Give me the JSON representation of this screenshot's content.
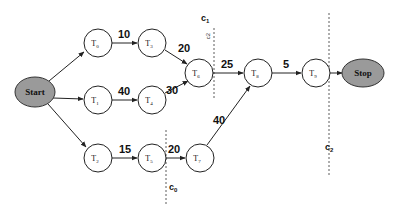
{
  "diagram": {
    "type": "task-graph",
    "terminals": {
      "start": {
        "label": "Start",
        "cx": 35,
        "cy": 92
      },
      "stop": {
        "label": "Stop",
        "cx": 363,
        "cy": 73
      }
    },
    "nodes": [
      {
        "id": "T0",
        "base": "T",
        "sub": "0",
        "cx": 98,
        "cy": 43
      },
      {
        "id": "T3",
        "base": "T",
        "sub": "3",
        "cx": 152,
        "cy": 43
      },
      {
        "id": "T1",
        "base": "T",
        "sub": "1",
        "cx": 98,
        "cy": 100
      },
      {
        "id": "T4",
        "base": "T",
        "sub": "4",
        "cx": 152,
        "cy": 100
      },
      {
        "id": "T2",
        "base": "T",
        "sub": "2",
        "cx": 98,
        "cy": 158
      },
      {
        "id": "T5",
        "base": "T",
        "sub": "5",
        "cx": 152,
        "cy": 158
      },
      {
        "id": "T7",
        "base": "T",
        "sub": "7",
        "cx": 200,
        "cy": 158
      },
      {
        "id": "T6",
        "base": "T",
        "sub": "6",
        "cx": 199,
        "cy": 73
      },
      {
        "id": "T8",
        "base": "T",
        "sub": "8",
        "cx": 258,
        "cy": 73
      },
      {
        "id": "T9",
        "base": "T",
        "sub": "9",
        "cx": 316,
        "cy": 73
      }
    ],
    "edges": [
      {
        "from": "Start",
        "to": "T0",
        "weight": ""
      },
      {
        "from": "Start",
        "to": "T1",
        "weight": ""
      },
      {
        "from": "Start",
        "to": "T2",
        "weight": ""
      },
      {
        "from": "T0",
        "to": "T3",
        "weight": "10"
      },
      {
        "from": "T3",
        "to": "T6",
        "weight": "20"
      },
      {
        "from": "T1",
        "to": "T4",
        "weight": "40"
      },
      {
        "from": "T4",
        "to": "T6",
        "weight": "30"
      },
      {
        "from": "T2",
        "to": "T5",
        "weight": "15"
      },
      {
        "from": "T5",
        "to": "T7",
        "weight": "20"
      },
      {
        "from": "T7",
        "to": "T8",
        "weight": "40"
      },
      {
        "from": "T6",
        "to": "T8",
        "weight": "25"
      },
      {
        "from": "T8",
        "to": "T9",
        "weight": "5"
      },
      {
        "from": "T9",
        "to": "Stop",
        "weight": ""
      }
    ],
    "cuts": [
      {
        "id": "c0",
        "base": "c",
        "sub": "0"
      },
      {
        "id": "c1",
        "base": "c",
        "sub": "1",
        "rotated_note": "c2"
      },
      {
        "id": "c2",
        "base": "c",
        "sub": "2"
      }
    ]
  }
}
